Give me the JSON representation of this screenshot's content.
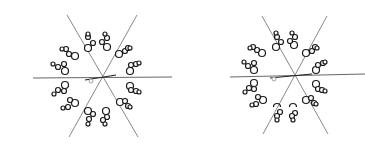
{
  "figure": {
    "background": "#ffffff",
    "panels": [
      {
        "id": "left",
        "center": [
          103,
          78
        ],
        "mirror_lines": [
          {
            "x1": 67,
            "y1": 15,
            "x2": 138,
            "y2": 137
          },
          {
            "x1": 137,
            "y1": 15,
            "x2": 69,
            "y2": 137
          }
        ],
        "horizontal_line": {
          "x1": 33,
          "y1": 78,
          "x2": 172,
          "y2": 77
        },
        "center_marks": [
          {
            "type": "stroke",
            "x1": 85,
            "y1": 80,
            "x2": 116,
            "y2": 75
          },
          {
            "type": "small-circle",
            "cx": 91,
            "cy": 81,
            "r": 2
          }
        ],
        "clusters": [
          {
            "atoms": [
              [
                88,
                48,
                3.5
              ],
              [
                93,
                43,
                2.5
              ],
              [
                88,
                37,
                2.5
              ],
              [
                88,
                34,
                2
              ]
            ]
          },
          {
            "atoms": [
              [
                107,
                47,
                3.5
              ],
              [
                102,
                42,
                2.5
              ],
              [
                107,
                38,
                2.5
              ],
              [
                105,
                34,
                2
              ]
            ]
          },
          {
            "atoms": [
              [
                119,
                54,
                3.5
              ],
              [
                125,
                51,
                2.5
              ],
              [
                128,
                48,
                2.5
              ],
              [
                130,
                48,
                2
              ]
            ]
          },
          {
            "atoms": [
              [
                130,
                71,
                3.5
              ],
              [
                131,
                65,
                2.5
              ],
              [
                136,
                64,
                2.5
              ],
              [
                139,
                63,
                2
              ]
            ]
          },
          {
            "atoms": [
              [
                130,
                86,
                3.5
              ],
              [
                131,
                90,
                2.5
              ],
              [
                136,
                91,
                2.5
              ],
              [
                139,
                92,
                2
              ]
            ]
          },
          {
            "atoms": [
              [
                120,
                102,
                3.5
              ],
              [
                125,
                101,
                2.5
              ],
              [
                128,
                106,
                2.5
              ],
              [
                130,
                107,
                2
              ]
            ]
          },
          {
            "atoms": [
              [
                88,
                111,
                3.5
              ],
              [
                93,
                114,
                2.5
              ],
              [
                89,
                119,
                2.5
              ],
              [
                88,
                124,
                2
              ]
            ]
          },
          {
            "atoms": [
              [
                106,
                111,
                3.5
              ],
              [
                107,
                117,
                2.5
              ],
              [
                103,
                120,
                2.5
              ],
              [
                105,
                124,
                2
              ]
            ]
          },
          {
            "atoms": [
              [
                75,
                56,
                3.5
              ],
              [
                69,
                54,
                2.5
              ],
              [
                66,
                49,
                2.5
              ],
              [
                62,
                49,
                2
              ]
            ]
          },
          {
            "atoms": [
              [
                65,
                71,
                3.5
              ],
              [
                64,
                64,
                2.5
              ],
              [
                58,
                67,
                2.5
              ],
              [
                53,
                64,
                2
              ]
            ]
          },
          {
            "atoms": [
              [
                65,
                85,
                3.5
              ],
              [
                64,
                91,
                2.5
              ],
              [
                58,
                90,
                2.5
              ],
              [
                54,
                94,
                2
              ]
            ]
          },
          {
            "atoms": [
              [
                75,
                103,
                3.5
              ],
              [
                70,
                100,
                2.5
              ],
              [
                68,
                107,
                2.5
              ],
              [
                63,
                108,
                2
              ]
            ]
          }
        ]
      },
      {
        "id": "right",
        "center": [
          295,
          77
        ],
        "mirror_lines": [
          {
            "x1": 262,
            "y1": 16,
            "x2": 328,
            "y2": 134
          },
          {
            "x1": 327,
            "y1": 16,
            "x2": 263,
            "y2": 134
          }
        ],
        "horizontal_line": {
          "x1": 230,
          "y1": 77,
          "x2": 365,
          "y2": 74
        },
        "center_marks": [
          {
            "type": "stroke",
            "x1": 270,
            "y1": 78,
            "x2": 312,
            "y2": 74
          },
          {
            "type": "small-circle",
            "cx": 274,
            "cy": 79,
            "r": 2
          }
        ],
        "clusters": [
          {
            "atoms": [
              [
                276,
                47,
                3.5
              ],
              [
                281,
                42,
                2.5
              ],
              [
                277,
                37,
                2.5
              ],
              [
                276,
                33,
                2
              ]
            ]
          },
          {
            "atoms": [
              [
                294,
                45,
                3.5
              ],
              [
                290,
                41,
                2.5
              ],
              [
                295,
                37,
                2.5
              ],
              [
                292,
                33,
                2
              ]
            ]
          },
          {
            "atoms": [
              [
                306,
                53,
                3.5
              ],
              [
                312,
                51,
                2.5
              ],
              [
                315,
                47,
                2.5
              ],
              [
                317,
                48,
                2
              ]
            ]
          },
          {
            "atoms": [
              [
                316,
                70,
                3.5
              ],
              [
                318,
                65,
                2.5
              ],
              [
                323,
                63,
                2.5
              ],
              [
                325,
                62,
                2
              ]
            ]
          },
          {
            "atoms": [
              [
                316,
                84,
                3.5
              ],
              [
                318,
                89,
                2.5
              ],
              [
                322,
                90,
                2.5
              ],
              [
                325,
                91,
                2
              ]
            ]
          },
          {
            "atoms": [
              [
                306,
                100,
                3.5
              ],
              [
                311,
                98,
                2.5
              ],
              [
                314,
                103,
                2.5
              ],
              [
                316,
                104,
                2
              ]
            ]
          },
          {
            "atoms": [
              [
                293,
                107,
                3.5,
                "open"
              ],
              [
                295,
                113,
                2.5
              ],
              [
                292,
                116,
                2.5
              ],
              [
                293,
                120,
                2
              ]
            ]
          },
          {
            "atoms": [
              [
                277,
                107,
                3.5,
                "open"
              ],
              [
                280,
                112,
                2.5
              ],
              [
                277,
                116,
                2.5
              ],
              [
                277,
                120,
                2
              ]
            ]
          },
          {
            "atoms": [
              [
                262,
                53,
                3.5
              ],
              [
                257,
                50,
                2.5
              ],
              [
                253,
                47,
                2.5
              ],
              [
                250,
                48,
                2
              ]
            ]
          },
          {
            "atoms": [
              [
                254,
                70,
                3.5
              ],
              [
                254,
                63,
                2.5
              ],
              [
                248,
                66,
                2.5
              ],
              [
                244,
                62,
                2
              ]
            ]
          },
          {
            "atoms": [
              [
                254,
                83,
                3.5
              ],
              [
                254,
                89,
                2.5
              ],
              [
                249,
                88,
                2.5
              ],
              [
                245,
                92,
                2
              ]
            ]
          },
          {
            "atoms": [
              [
                263,
                100,
                3.5
              ],
              [
                258,
                97,
                2.5
              ],
              [
                256,
                104,
                2.5
              ],
              [
                252,
                105,
                2
              ]
            ]
          }
        ]
      }
    ]
  }
}
